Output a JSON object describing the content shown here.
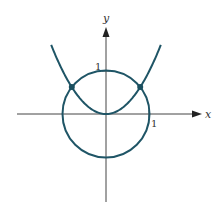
{
  "figure": {
    "axes": {
      "x_label": "x",
      "y_label": "y",
      "x_tick_label": "1",
      "y_tick_label": "1"
    },
    "curves": [
      {
        "name": "parabola",
        "equation": "y = x^2"
      },
      {
        "name": "unit-circle",
        "equation": "x^2 + y^2 = 1"
      }
    ],
    "intersection_points": [
      {
        "x": -0.786,
        "y": 0.618
      },
      {
        "x": 0.786,
        "y": 0.618
      }
    ],
    "colors": {
      "curve": "#1f5566",
      "axis": "#444444",
      "point": "#1a4f5f"
    }
  }
}
